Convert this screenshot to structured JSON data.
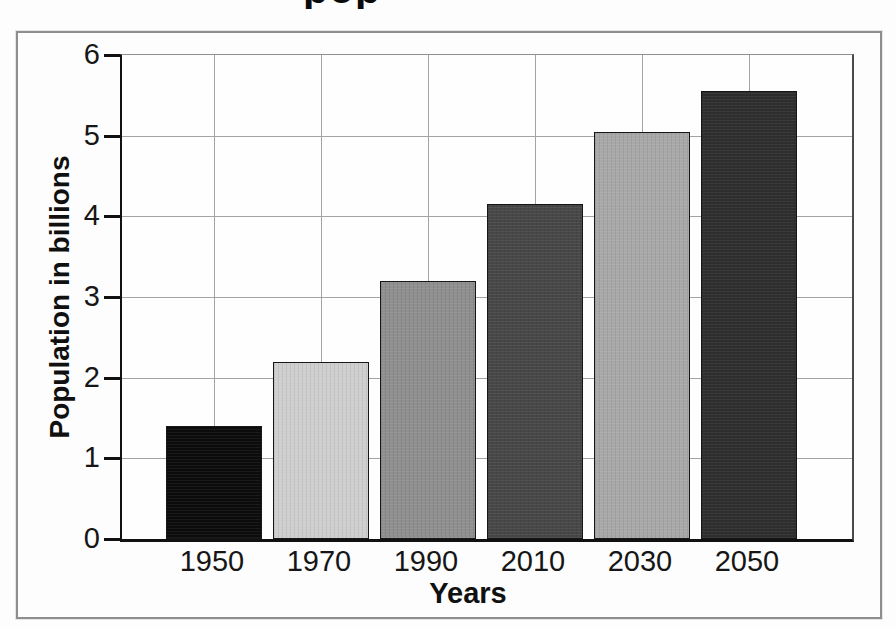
{
  "figure": {
    "cropped_title_descenders": "pop",
    "frame_border_color": "#8e8e8e",
    "background_color": "#fdfdfd"
  },
  "chart_data": {
    "type": "bar",
    "title": "",
    "categories": [
      "1950",
      "1970",
      "1990",
      "2010",
      "2030",
      "2050"
    ],
    "values": [
      1.4,
      2.2,
      3.2,
      4.15,
      5.05,
      5.55
    ],
    "xlabel": "Years",
    "ylabel": "Population in billions",
    "ylim": [
      0,
      6
    ],
    "yticks": [
      0,
      1,
      2,
      3,
      4,
      5,
      6
    ],
    "grid": true,
    "legend": false,
    "axis_color": "#111111",
    "gridline_color": "#a3a3a3",
    "bar_colors": [
      "#0c0c0c",
      "#cfcfcf",
      "#8f8f8f",
      "#474747",
      "#a8a8a8",
      "#2e2e2e"
    ]
  }
}
